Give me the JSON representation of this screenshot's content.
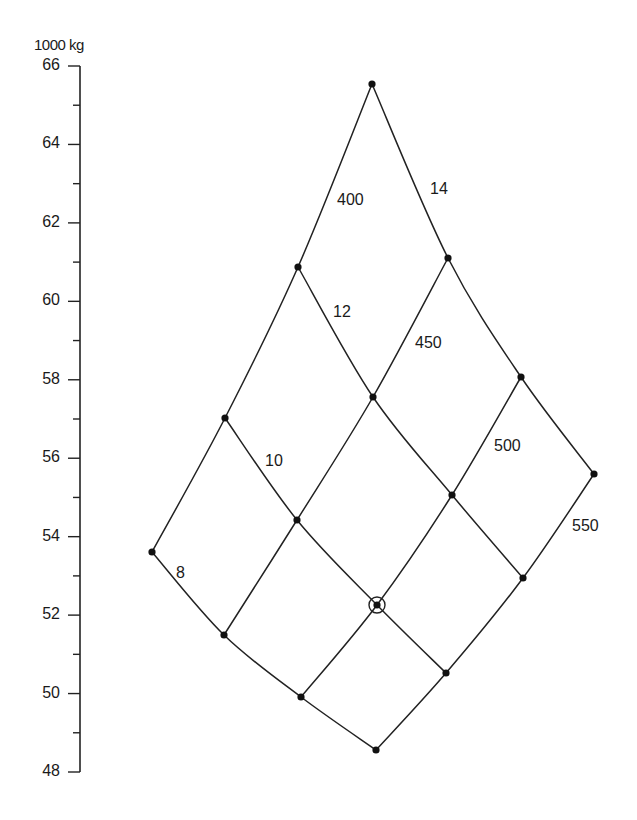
{
  "chart_data": {
    "type": "scatter",
    "subtype": "carpet-plot",
    "title": "",
    "ylabel": "1000 kg",
    "xlabel": "",
    "ylim": [
      48,
      66
    ],
    "y_major_ticks": [
      48,
      50,
      52,
      54,
      56,
      58,
      60,
      62,
      64,
      66
    ],
    "y_minor_step": 1,
    "grid": false,
    "legend": null,
    "family_a": {
      "description": "lines rising lower-left to upper-right",
      "labels": [
        "400",
        "450",
        "500",
        "550"
      ]
    },
    "family_b": {
      "description": "lines falling upper-left to lower-right",
      "labels": [
        "8",
        "10",
        "12",
        "14"
      ]
    },
    "nodes": [
      {
        "a": "400",
        "b": "8",
        "y": 53.6
      },
      {
        "a": "400",
        "b": "10",
        "y": 57.0
      },
      {
        "a": "400",
        "b": "12",
        "y": 60.9
      },
      {
        "a": "400",
        "b": "14",
        "y": 65.5
      },
      {
        "a": "450",
        "b": "8",
        "y": 51.5
      },
      {
        "a": "450",
        "b": "10",
        "y": 54.4
      },
      {
        "a": "450",
        "b": "12",
        "y": 57.6
      },
      {
        "a": "450",
        "b": "14",
        "y": 61.1
      },
      {
        "a": "500",
        "b": "8",
        "y": 49.9
      },
      {
        "a": "500",
        "b": "10",
        "y": 52.3,
        "highlighted": true
      },
      {
        "a": "500",
        "b": "12",
        "y": 55.1
      },
      {
        "a": "500",
        "b": "14",
        "y": 58.1
      },
      {
        "a": "550",
        "b": "8",
        "y": 48.6
      },
      {
        "a": "550",
        "b": "10",
        "y": 50.5
      },
      {
        "a": "550",
        "b": "12",
        "y": 53.0
      },
      {
        "a": "550",
        "b": "14",
        "y": 55.6
      }
    ],
    "annotations": [
      {
        "text": "400",
        "x": 337,
        "y": 201
      },
      {
        "text": "450",
        "x": 415,
        "y": 344
      },
      {
        "text": "500",
        "x": 494,
        "y": 447
      },
      {
        "text": "550",
        "x": 572,
        "y": 527
      },
      {
        "text": "14",
        "x": 430,
        "y": 190
      },
      {
        "text": "12",
        "x": 333,
        "y": 313
      },
      {
        "text": "10",
        "x": 265,
        "y": 462
      },
      {
        "text": "8",
        "x": 176,
        "y": 574
      }
    ]
  },
  "layout": {
    "axis_x": 80,
    "y_top_px": 66,
    "y_bottom_px": 772,
    "node_px": {
      "400": [
        [
          152,
          552
        ],
        [
          225,
          418
        ],
        [
          298,
          267
        ],
        [
          372,
          84
        ]
      ],
      "450": [
        [
          224,
          635
        ],
        [
          297,
          520
        ],
        [
          373,
          397
        ],
        [
          448,
          258
        ]
      ],
      "500": [
        [
          301,
          697
        ],
        [
          377,
          605
        ],
        [
          452,
          495
        ],
        [
          521,
          377
        ]
      ],
      "550": [
        [
          376,
          750
        ],
        [
          446,
          673
        ],
        [
          523,
          578
        ],
        [
          594,
          474
        ]
      ]
    },
    "highlight_px": [
      377,
      605
    ],
    "line_color": "#222222",
    "dot_color": "#111111"
  }
}
